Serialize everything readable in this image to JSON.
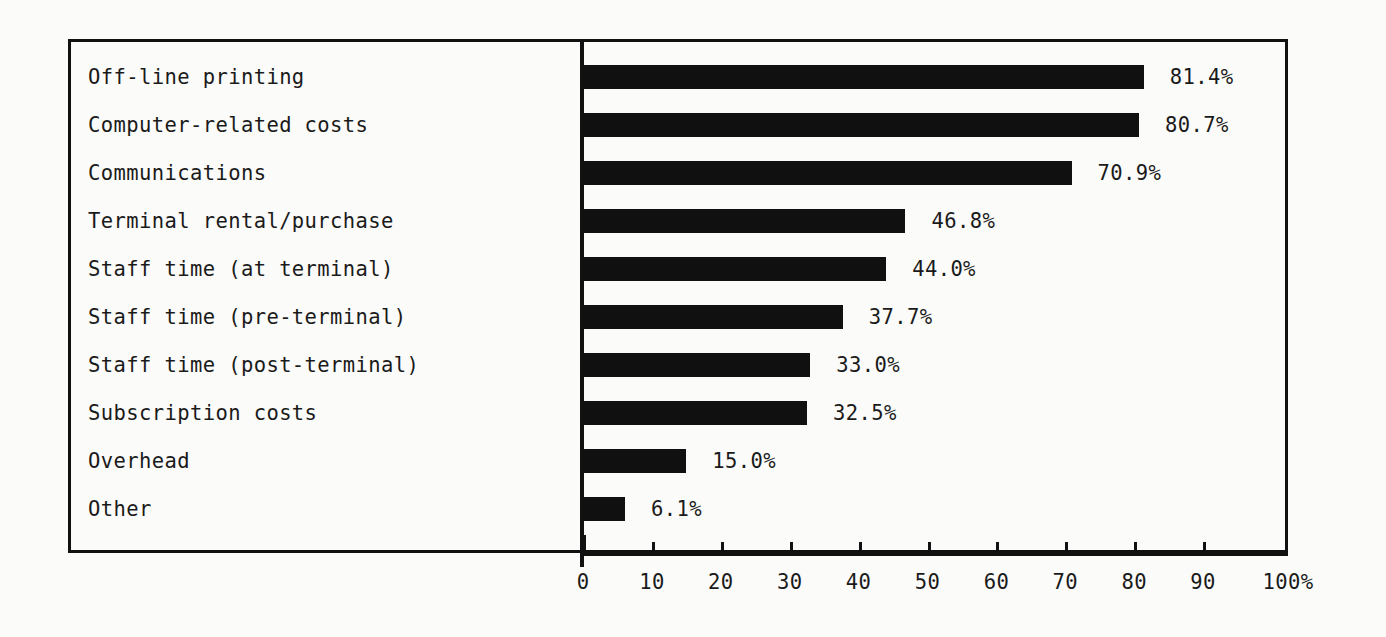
{
  "chart_data": {
    "type": "bar",
    "orientation": "horizontal",
    "title": "",
    "subtitle": "",
    "xlabel": "",
    "ylabel": "",
    "xlim": [
      0,
      100
    ],
    "grid": false,
    "legend": null,
    "categories": [
      "Off-line printing",
      "Computer-related costs",
      "Communications",
      "Terminal rental/purchase",
      "Staff time (at terminal)",
      "Staff time (pre-terminal)",
      "Staff time (post-terminal)",
      "Subscription costs",
      "Overhead",
      "Other"
    ],
    "values": [
      81.4,
      80.7,
      70.9,
      46.8,
      44.0,
      37.7,
      33.0,
      32.5,
      15.0,
      6.1
    ],
    "value_labels": [
      "81.4%",
      "80.7%",
      "70.9%",
      "46.8%",
      "44.0%",
      "37.7%",
      "33.0%",
      "32.5%",
      "15.0%",
      "6.1%"
    ],
    "xticks": [
      0,
      10,
      20,
      30,
      40,
      50,
      60,
      70,
      80,
      90,
      100
    ],
    "xtick_labels": [
      "0",
      "10",
      "20",
      "30",
      "40",
      "50",
      "60",
      "70",
      "80",
      "90",
      "100%"
    ],
    "bar_color": "#101010",
    "background_color": "#fbfbf9",
    "axis_color": "#111111"
  }
}
